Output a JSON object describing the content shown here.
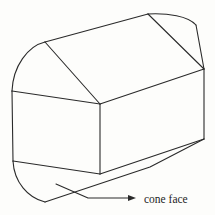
{
  "diagram": {
    "type": "line-drawing",
    "annotation": {
      "label": "cone face",
      "arrow": "leader-line-with-arrowhead"
    },
    "colors": {
      "stroke": "#2a2a2a",
      "background": "#fdfdfb",
      "text": "#1e1e1e"
    }
  }
}
